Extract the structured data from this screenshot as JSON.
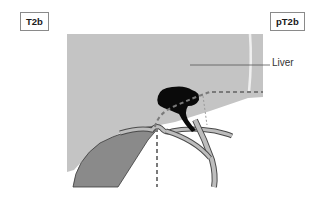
{
  "labels": {
    "clinical_stage": "T2b",
    "pathologic_stage": "pT2b",
    "organ": "Liver"
  },
  "colors": {
    "liver": "#c4c4c4",
    "tumor": "#0a0a0a",
    "gallbladder": "#8a8a8a",
    "duct": "#bdbdbd",
    "duct_outline": "#4a4a4a",
    "dashed_boundary": "#7a7a7a",
    "leader_line": "#555555"
  },
  "icons": {
    "tumor": "tumor-mass-shape",
    "gallbladder": "gallbladder-shape",
    "bile-duct": "bile-duct-shape"
  }
}
